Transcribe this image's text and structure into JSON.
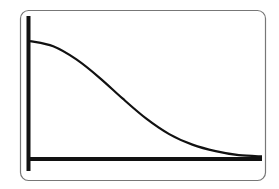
{
  "chart_data": {
    "type": "line",
    "title": "",
    "xlabel": "",
    "ylabel": "",
    "x": [
      0,
      0.1,
      0.2,
      0.3,
      0.4,
      0.5,
      0.6,
      0.7,
      0.8,
      0.9,
      1.0
    ],
    "values": [
      0.9,
      0.86,
      0.76,
      0.62,
      0.46,
      0.31,
      0.19,
      0.11,
      0.06,
      0.03,
      0.02
    ],
    "xlim": [
      0,
      1
    ],
    "ylim": [
      0,
      1
    ],
    "grid": false,
    "legend": null
  },
  "colors": {
    "frame": "#777777",
    "axis": "#111111",
    "curve": "#111111",
    "background": "#ffffff"
  }
}
